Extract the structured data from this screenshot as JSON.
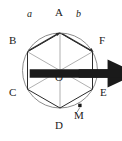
{
  "figure": {
    "type": "geometry-diagram",
    "width": 122,
    "height": 141,
    "colors": {
      "stroke": "#2b2b2b",
      "circle": "#7a7a7a",
      "diagonal": "#8a8a8a",
      "text": "#1a1a1a",
      "background": "#ffffff"
    },
    "circle": {
      "cx": 60,
      "cy": 70.5,
      "r": 37.5
    },
    "vertices": [
      {
        "name": "A",
        "x": 60,
        "y": 33,
        "label_x": 56,
        "label_y": 12
      },
      {
        "name": "B",
        "x": 27.5,
        "y": 51.8,
        "label_x": 11,
        "label_y": 38
      },
      {
        "name": "C",
        "x": 27.5,
        "y": 89.3,
        "label_x": 11,
        "label_y": 90
      },
      {
        "name": "D",
        "x": 60,
        "y": 108,
        "label_x": 56,
        "label_y": 123
      },
      {
        "name": "E",
        "x": 92.5,
        "y": 89.3,
        "label_x": 101,
        "label_y": 90
      },
      {
        "name": "F",
        "x": 92.5,
        "y": 51.8,
        "label_x": 100,
        "label_y": 38
      }
    ],
    "center": {
      "name": "O",
      "x": 60,
      "y": 70.5,
      "label_x": 56,
      "label_y": 74
    },
    "point_m": {
      "name": "M",
      "x": 80,
      "y": 105.5,
      "label_x": 78,
      "label_y": 112
    },
    "vectors": [
      {
        "name": "a",
        "label": "a",
        "from": "B",
        "to": "A",
        "label_x": 28,
        "label_y": 11
      },
      {
        "name": "b",
        "label": "b",
        "from": "A",
        "to": "F",
        "label_x": 77,
        "label_y": 11
      }
    ],
    "diagonals": [
      "AD",
      "BE",
      "CF"
    ],
    "sides": [
      "AB",
      "BC",
      "CD",
      "DE",
      "EF",
      "FA"
    ]
  }
}
